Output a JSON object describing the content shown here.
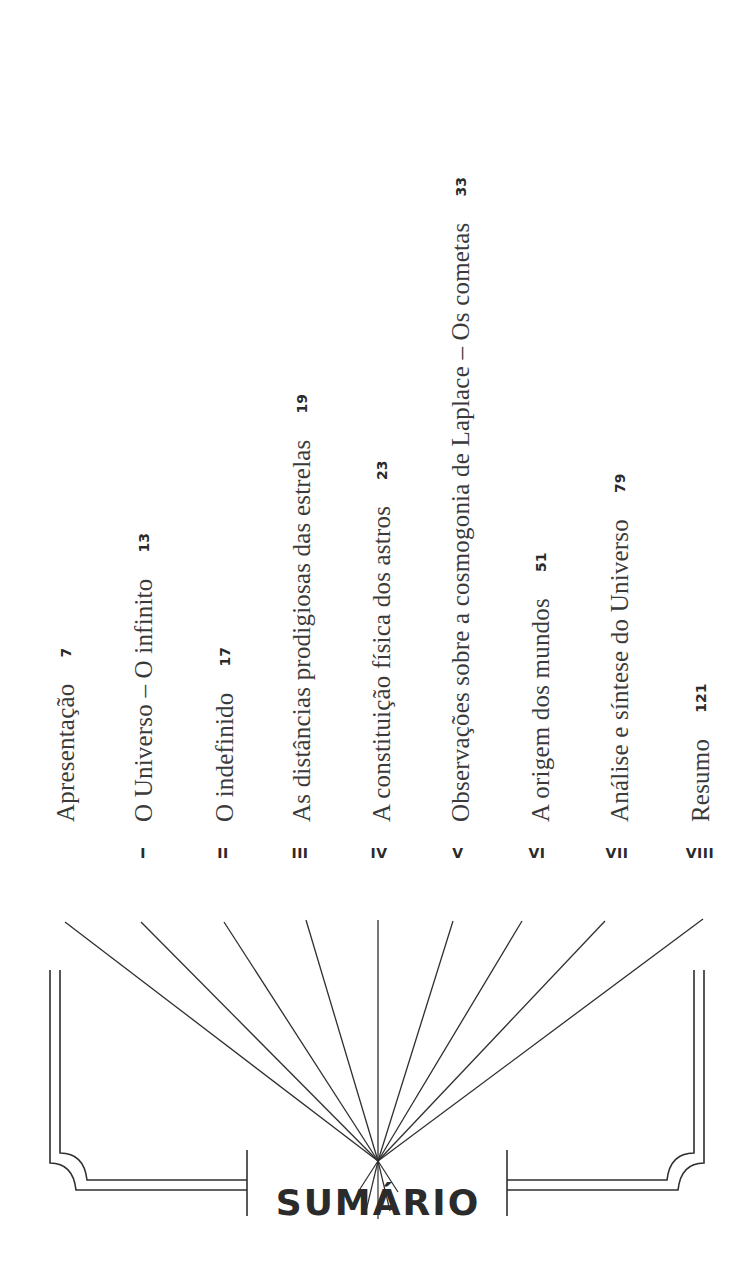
{
  "heading": "SUMÁRIO",
  "entries": [
    {
      "numeral": "",
      "title": "Apresentação",
      "page": "7"
    },
    {
      "numeral": "I",
      "title": "O Universo – O infinito",
      "page": "13"
    },
    {
      "numeral": "II",
      "title": "O indefinido",
      "page": "17"
    },
    {
      "numeral": "III",
      "title": "As distâncias prodigiosas das estrelas",
      "page": "19"
    },
    {
      "numeral": "IV",
      "title": "A constituição física dos astros",
      "page": "23"
    },
    {
      "numeral": "V",
      "title": "Observações sobre a cosmogonia de Laplace – Os cometas",
      "page": "33"
    },
    {
      "numeral": "VI",
      "title": "A origem dos mundos",
      "page": "51"
    },
    {
      "numeral": "VII",
      "title": "Análise e síntese do Universo",
      "page": "79"
    },
    {
      "numeral": "VIII",
      "title": "Resumo",
      "page": "121"
    }
  ],
  "colors": {
    "ink": "#2b2b2b",
    "paper": "#ffffff"
  }
}
